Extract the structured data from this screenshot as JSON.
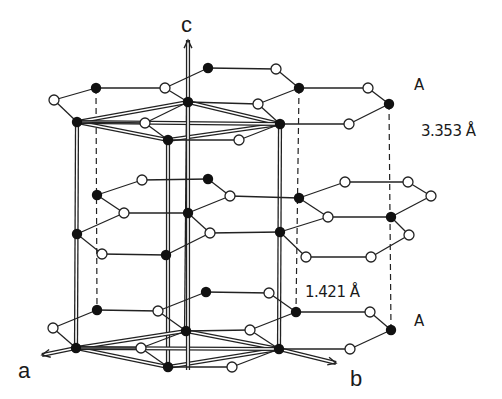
{
  "labels": {
    "axis_c": "c",
    "axis_a": "a",
    "axis_b": "b",
    "layer_top": "A",
    "layer_bottom": "A",
    "interlayer_distance": "3.353 Å",
    "bond_length": "1.421 Å"
  },
  "colors": {
    "line": "#222222",
    "atom_filled": "#111111",
    "atom_open_fill": "#ffffff",
    "background": "#ffffff"
  },
  "layers": [
    {
      "name": "top-A",
      "filled": [
        [
          96,
          88
        ],
        [
          208,
          68
        ],
        [
          299,
          88
        ],
        [
          389,
          104
        ],
        [
          77,
          122
        ],
        [
          188,
          102
        ],
        [
          280,
          124
        ],
        [
          168,
          140
        ]
      ],
      "open": [
        [
          54,
          100
        ],
        [
          165,
          88
        ],
        [
          276,
          69
        ],
        [
          368,
          88
        ],
        [
          349,
          124
        ],
        [
          258,
          104
        ],
        [
          145,
          123
        ],
        [
          239,
          140
        ]
      ],
      "bonds": [
        [
          [
            54,
            100
          ],
          [
            96,
            88
          ]
        ],
        [
          [
            96,
            88
          ],
          [
            165,
            88
          ]
        ],
        [
          [
            165,
            88
          ],
          [
            208,
            68
          ]
        ],
        [
          [
            208,
            68
          ],
          [
            276,
            69
          ]
        ],
        [
          [
            276,
            69
          ],
          [
            299,
            88
          ]
        ],
        [
          [
            299,
            88
          ],
          [
            368,
            88
          ]
        ],
        [
          [
            368,
            88
          ],
          [
            389,
            104
          ]
        ],
        [
          [
            389,
            104
          ],
          [
            349,
            124
          ]
        ],
        [
          [
            349,
            124
          ],
          [
            280,
            124
          ]
        ],
        [
          [
            54,
            100
          ],
          [
            77,
            122
          ]
        ],
        [
          [
            77,
            122
          ],
          [
            145,
            123
          ]
        ],
        [
          [
            145,
            123
          ],
          [
            168,
            140
          ]
        ],
        [
          [
            168,
            140
          ],
          [
            239,
            140
          ]
        ],
        [
          [
            239,
            140
          ],
          [
            280,
            124
          ]
        ],
        [
          [
            165,
            88
          ],
          [
            188,
            102
          ]
        ],
        [
          [
            188,
            102
          ],
          [
            258,
            104
          ]
        ],
        [
          [
            258,
            104
          ],
          [
            299,
            88
          ]
        ],
        [
          [
            258,
            104
          ],
          [
            280,
            124
          ]
        ],
        [
          [
            145,
            123
          ],
          [
            188,
            102
          ]
        ]
      ]
    },
    {
      "name": "middle-B",
      "filled": [
        [
          97,
          195
        ],
        [
          208,
          179
        ],
        [
          188,
          213
        ],
        [
          166,
          255
        ],
        [
          77,
          234
        ],
        [
          299,
          198
        ],
        [
          391,
          217
        ],
        [
          280,
          232
        ]
      ],
      "open": [
        [
          142,
          180
        ],
        [
          230,
          196
        ],
        [
          210,
          233
        ],
        [
          102,
          254
        ],
        [
          124,
          213
        ],
        [
          345,
          182
        ],
        [
          408,
          182
        ],
        [
          431,
          196
        ],
        [
          409,
          235
        ],
        [
          371,
          257
        ],
        [
          306,
          257
        ],
        [
          328,
          217
        ]
      ],
      "bonds": [
        [
          [
            97,
            195
          ],
          [
            142,
            180
          ]
        ],
        [
          [
            142,
            180
          ],
          [
            208,
            179
          ]
        ],
        [
          [
            208,
            179
          ],
          [
            230,
            196
          ]
        ],
        [
          [
            230,
            196
          ],
          [
            299,
            198
          ]
        ],
        [
          [
            299,
            198
          ],
          [
            345,
            182
          ]
        ],
        [
          [
            345,
            182
          ],
          [
            408,
            182
          ]
        ],
        [
          [
            408,
            182
          ],
          [
            431,
            196
          ]
        ],
        [
          [
            431,
            196
          ],
          [
            391,
            217
          ]
        ],
        [
          [
            391,
            217
          ],
          [
            409,
            235
          ]
        ],
        [
          [
            409,
            235
          ],
          [
            371,
            257
          ]
        ],
        [
          [
            371,
            257
          ],
          [
            306,
            257
          ]
        ],
        [
          [
            306,
            257
          ],
          [
            280,
            232
          ]
        ],
        [
          [
            280,
            232
          ],
          [
            328,
            217
          ]
        ],
        [
          [
            328,
            217
          ],
          [
            299,
            198
          ]
        ],
        [
          [
            328,
            217
          ],
          [
            391,
            217
          ]
        ],
        [
          [
            230,
            196
          ],
          [
            188,
            213
          ]
        ],
        [
          [
            188,
            213
          ],
          [
            124,
            213
          ]
        ],
        [
          [
            124,
            213
          ],
          [
            97,
            195
          ]
        ],
        [
          [
            124,
            213
          ],
          [
            77,
            234
          ]
        ],
        [
          [
            77,
            234
          ],
          [
            102,
            254
          ]
        ],
        [
          [
            102,
            254
          ],
          [
            166,
            255
          ]
        ],
        [
          [
            166,
            255
          ],
          [
            210,
            233
          ]
        ],
        [
          [
            210,
            233
          ],
          [
            188,
            213
          ]
        ],
        [
          [
            210,
            233
          ],
          [
            280,
            232
          ]
        ]
      ]
    },
    {
      "name": "bottom-A",
      "filled": [
        [
          97,
          310
        ],
        [
          206,
          292
        ],
        [
          296,
          312
        ],
        [
          391,
          330
        ],
        [
          76,
          348
        ],
        [
          186,
          331
        ],
        [
          279,
          349
        ],
        [
          168,
          367
        ]
      ],
      "open": [
        [
          53,
          328
        ],
        [
          158,
          311
        ],
        [
          269,
          293
        ],
        [
          370,
          312
        ],
        [
          350,
          349
        ],
        [
          141,
          348
        ],
        [
          250,
          330
        ],
        [
          232,
          367
        ]
      ],
      "bonds": [
        [
          [
            53,
            328
          ],
          [
            97,
            310
          ]
        ],
        [
          [
            97,
            310
          ],
          [
            158,
            311
          ]
        ],
        [
          [
            158,
            311
          ],
          [
            206,
            292
          ]
        ],
        [
          [
            206,
            292
          ],
          [
            269,
            293
          ]
        ],
        [
          [
            269,
            293
          ],
          [
            296,
            312
          ]
        ],
        [
          [
            296,
            312
          ],
          [
            370,
            312
          ]
        ],
        [
          [
            370,
            312
          ],
          [
            391,
            330
          ]
        ],
        [
          [
            391,
            330
          ],
          [
            350,
            349
          ]
        ],
        [
          [
            350,
            349
          ],
          [
            279,
            349
          ]
        ],
        [
          [
            53,
            328
          ],
          [
            76,
            348
          ]
        ],
        [
          [
            76,
            348
          ],
          [
            141,
            348
          ]
        ],
        [
          [
            141,
            348
          ],
          [
            168,
            367
          ]
        ],
        [
          [
            168,
            367
          ],
          [
            232,
            367
          ]
        ],
        [
          [
            232,
            367
          ],
          [
            279,
            349
          ]
        ],
        [
          [
            158,
            311
          ],
          [
            186,
            331
          ]
        ],
        [
          [
            186,
            331
          ],
          [
            250,
            330
          ]
        ],
        [
          [
            250,
            330
          ],
          [
            296,
            312
          ]
        ],
        [
          [
            250,
            330
          ],
          [
            279,
            349
          ]
        ],
        [
          [
            141,
            348
          ],
          [
            186,
            331
          ]
        ]
      ]
    }
  ],
  "unit_cell": {
    "top": [
      [
        77,
        122
      ],
      [
        188,
        102
      ],
      [
        280,
        124
      ],
      [
        168,
        140
      ]
    ],
    "bottom": [
      [
        76,
        348
      ],
      [
        186,
        331
      ],
      [
        279,
        349
      ],
      [
        168,
        367
      ]
    ]
  },
  "dashed_verticals": [
    [
      [
        96,
        88
      ],
      [
        97,
        310
      ]
    ],
    [
      [
        299,
        88
      ],
      [
        296,
        312
      ]
    ],
    [
      [
        389,
        104
      ],
      [
        391,
        330
      ]
    ]
  ],
  "axes": {
    "c": {
      "from": [
        188,
        370
      ],
      "to": [
        188,
        40
      ]
    },
    "a": {
      "from": [
        76,
        348
      ],
      "to": [
        42,
        355
      ]
    },
    "b": {
      "from": [
        279,
        349
      ],
      "to": [
        336,
        363
      ]
    }
  }
}
